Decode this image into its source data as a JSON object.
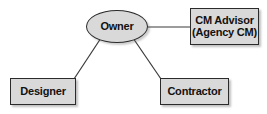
{
  "diagram": {
    "type": "organizational-relationship-diagram",
    "background_color": "#ffffff",
    "node_fill_color": "#d9d9d9",
    "node_border_color": "#2b2b2b",
    "text_color": "#111111",
    "edge_color": "#3a3a3a",
    "nodes": [
      {
        "id": "owner",
        "shape": "ellipse",
        "lines": [
          "Owner"
        ],
        "label": "Owner"
      },
      {
        "id": "cm-advisor",
        "shape": "rectangle",
        "lines": [
          "CM Advisor",
          "(Agency CM)"
        ],
        "label": "CM Advisor (Agency CM)"
      },
      {
        "id": "designer",
        "shape": "rectangle",
        "lines": [
          "Designer"
        ],
        "label": "Designer"
      },
      {
        "id": "contractor",
        "shape": "rectangle",
        "lines": [
          "Contractor"
        ],
        "label": "Contractor"
      }
    ],
    "edges": [
      {
        "id": "owner-cm-advisor",
        "from": "owner",
        "to": "cm-advisor",
        "style": "solid",
        "orientation": "horizontal"
      },
      {
        "id": "owner-designer",
        "from": "owner",
        "to": "designer",
        "style": "solid",
        "orientation": "diagonal"
      },
      {
        "id": "owner-contractor",
        "from": "owner",
        "to": "contractor",
        "style": "solid",
        "orientation": "diagonal"
      }
    ]
  }
}
